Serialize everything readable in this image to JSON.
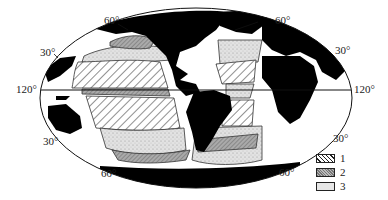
{
  "map": {
    "projection": "elliptical world map (Pacific-centered, Americas in middle)",
    "latitude_labels": {
      "top_left_60": "60°",
      "top_right_60": "60°",
      "left_30_north": "30°",
      "right_30_north": "30°",
      "left_equator": "120°",
      "right_equator": "120°",
      "left_30_south": "30°",
      "right_30_south": "30°",
      "bottom_left_60": "60°",
      "bottom_right_60": "60°"
    },
    "fill_colors": {
      "land": "#000000",
      "ocean": "#ffffff",
      "zone_2": "#9a9a9a",
      "zone_3": "#dcdcdc"
    }
  },
  "legend": {
    "items": [
      {
        "label": "1",
        "pattern": "diagonal-hatch"
      },
      {
        "label": "2",
        "pattern": "dark-stipple"
      },
      {
        "label": "3",
        "pattern": "light-stipple"
      }
    ]
  }
}
